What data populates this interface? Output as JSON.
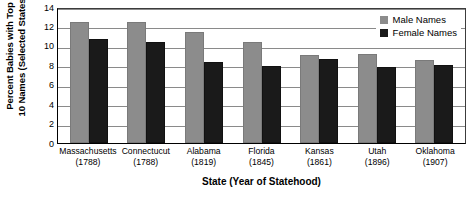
{
  "chart_data": {
    "type": "bar",
    "title": "",
    "xlabel": "State (Year of Statehood)",
    "ylabel": "Percent Babies with Top 10 Names (Selected States)",
    "ylabel_lines": [
      "Percent Babies  with Top",
      "10 Names (Selected States)"
    ],
    "categories": [
      "Massachusetts",
      "Connectucut",
      "Alabama",
      "Florida",
      "Kansas",
      "Utah",
      "Oklahoma"
    ],
    "category_sublabels": [
      "(1788)",
      "(1788)",
      "(1819)",
      "(1845)",
      "(1861)",
      "(1896)",
      "(1907)"
    ],
    "series": [
      {
        "name": "Male Names",
        "color": "#8c8c8c",
        "values": [
          12.3,
          12.3,
          11.2,
          10.2,
          8.9,
          9.0,
          8.3
        ]
      },
      {
        "name": "Female Names",
        "color": "#1a1a1a",
        "values": [
          10.5,
          10.2,
          8.1,
          7.7,
          8.4,
          7.6,
          7.8
        ]
      }
    ],
    "ylim": [
      0,
      14
    ],
    "yticks": [
      0,
      2,
      4,
      6,
      8,
      10,
      12,
      14
    ],
    "ytick_labels": [
      "0",
      "2",
      "4",
      "6",
      "8",
      "10",
      "12",
      "14"
    ],
    "grid": true,
    "grid_axis": "y",
    "legend_position": "top-right"
  }
}
